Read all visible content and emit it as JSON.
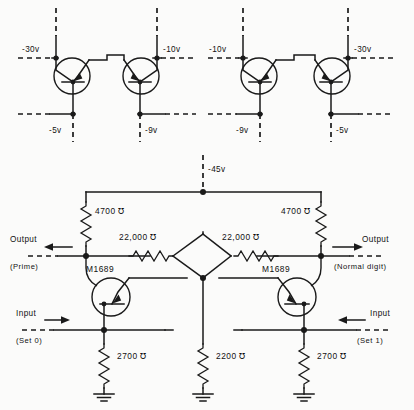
{
  "figure": {
    "ohm_symbol": "℧"
  },
  "top_left_stage": {
    "name": "bias-test-pair-left",
    "left_supply": "-30v",
    "right_supply": "-10v",
    "left_emitter": "-5v",
    "right_emitter": "-9v"
  },
  "top_right_stage": {
    "name": "bias-test-pair-right",
    "left_supply": "-10v",
    "right_supply": "-30v",
    "left_emitter": "-9v",
    "right_emitter": "-5v"
  },
  "main_circuit": {
    "supply_label": "-45v",
    "collector_resistor_left": "4700 ℧",
    "collector_resistor_right": "4700 ℧",
    "coupling_resistor_left": "22,000 ℧",
    "coupling_resistor_right": "22,000 ℧",
    "emitter_resistor_left": "2700 ℧",
    "emitter_resistor_center": "2200 ℧",
    "emitter_resistor_right": "2700 ℧",
    "transistor_left": "M1689",
    "transistor_right": "M1689",
    "output_left_label": "Output",
    "output_left_sub": "(Prime)",
    "output_right_label": "Output",
    "output_right_sub": "(Normal digit)",
    "input_left_label": "Input",
    "input_left_sub": "(Set 0)",
    "input_right_label": "Input",
    "input_right_sub": "(Set 1)"
  }
}
